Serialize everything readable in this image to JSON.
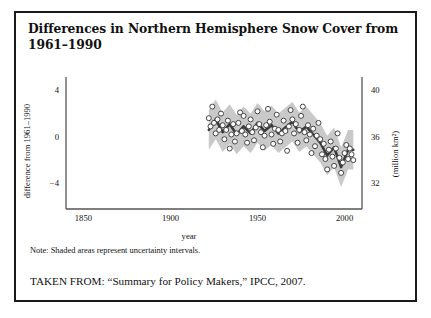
{
  "figure": {
    "title": "Differences in Northern Hemisphere Snow Cover from 1961–1990",
    "note": "Note: Shaded areas represent uncertainty intervals.",
    "source": "TAKEN FROM: “Summary for Policy Makers,” IPCC, 2007."
  },
  "colors": {
    "border": "#1a1a1a",
    "axis": "#555555",
    "trend_line": "#3a3a3a",
    "uncertainty_band": "#c9c9c9",
    "marker_fill": "#ffffff",
    "marker_stroke": "#444444",
    "text": "#111111"
  },
  "chart_data": {
    "type": "line",
    "title": "Differences in Northern Hemisphere Snow Cover from 1961–1990",
    "xlabel": "year",
    "ylabel": "difference from 1961–1990",
    "ylabel_right": "(million km²)",
    "xlim": [
      1840,
      2010
    ],
    "ylim": [
      -6.2,
      4.8
    ],
    "xticks": [
      1850,
      1900,
      1950,
      2000
    ],
    "yticks_left": [
      4,
      0,
      -4
    ],
    "yticks_right": [
      40,
      36,
      32
    ],
    "ylim_right": [
      29.8,
      40.8
    ],
    "grid": false,
    "legend": false,
    "series": [
      {
        "name": "annual anomaly",
        "type": "scatter",
        "marker": "open-circle",
        "x": [
          1922,
          1923,
          1924,
          1925,
          1926,
          1927,
          1928,
          1929,
          1930,
          1931,
          1932,
          1933,
          1934,
          1935,
          1936,
          1937,
          1938,
          1939,
          1940,
          1941,
          1942,
          1943,
          1944,
          1945,
          1946,
          1947,
          1948,
          1949,
          1950,
          1951,
          1952,
          1953,
          1954,
          1955,
          1956,
          1957,
          1958,
          1959,
          1960,
          1961,
          1962,
          1963,
          1964,
          1965,
          1966,
          1967,
          1968,
          1969,
          1970,
          1971,
          1972,
          1973,
          1974,
          1975,
          1976,
          1977,
          1978,
          1979,
          1980,
          1981,
          1982,
          1983,
          1984,
          1985,
          1986,
          1987,
          1988,
          1989,
          1990,
          1991,
          1992,
          1993,
          1994,
          1995,
          1996,
          1997,
          1998,
          1999,
          2000,
          2001,
          2002,
          2003,
          2004,
          2005
        ],
        "y": [
          1.6,
          0.9,
          2.6,
          1.2,
          0.3,
          1.5,
          0.6,
          2.0,
          1.0,
          -0.2,
          0.6,
          1.4,
          -1.0,
          0.2,
          1.1,
          -0.4,
          0.3,
          1.2,
          2.1,
          0.5,
          1.8,
          0.2,
          -0.5,
          0.9,
          1.5,
          0.4,
          -0.3,
          0.8,
          2.2,
          1.1,
          0.4,
          -0.9,
          0.1,
          1.0,
          2.4,
          1.3,
          0.2,
          -0.6,
          0.7,
          1.9,
          0.6,
          -0.4,
          0.3,
          1.4,
          0.5,
          -1.2,
          0.9,
          2.3,
          1.5,
          0.3,
          1.1,
          -0.5,
          0.6,
          1.8,
          2.6,
          0.4,
          -0.3,
          1.0,
          0.2,
          -1.4,
          0.7,
          -0.8,
          0.1,
          1.2,
          -0.2,
          -1.5,
          -0.6,
          -1.9,
          -2.8,
          -1.1,
          -0.4,
          -1.7,
          -2.5,
          -1.0,
          0.3,
          -1.8,
          -3.1,
          -2.2,
          -1.4,
          -0.7,
          -1.9,
          -1.0,
          -1.5,
          -2.0
        ]
      },
      {
        "name": "smoothed trend",
        "type": "line",
        "x": [
          1922,
          1926,
          1930,
          1934,
          1938,
          1942,
          1946,
          1950,
          1954,
          1958,
          1962,
          1966,
          1970,
          1974,
          1978,
          1982,
          1986,
          1990,
          1994,
          1998,
          2002,
          2005
        ],
        "y": [
          0.6,
          1.5,
          0.4,
          1.1,
          0.2,
          0.9,
          0.3,
          1.2,
          0.5,
          1.0,
          0.3,
          0.8,
          1.3,
          0.4,
          0.9,
          0.2,
          -0.5,
          -1.6,
          -0.9,
          -2.6,
          -1.1,
          -1.1
        ]
      },
      {
        "name": "uncertainty band",
        "type": "band",
        "x": [
          1922,
          1926,
          1930,
          1934,
          1938,
          1942,
          1946,
          1950,
          1954,
          1958,
          1962,
          1966,
          1970,
          1974,
          1978,
          1982,
          1986,
          1990,
          1994,
          1998,
          2002,
          2005
        ],
        "lower": [
          -1.1,
          -0.2,
          -1.3,
          -0.6,
          -1.5,
          -0.8,
          -1.4,
          -0.5,
          -1.2,
          -0.7,
          -1.4,
          -0.9,
          -0.4,
          -1.3,
          -0.8,
          -1.5,
          -2.2,
          -3.3,
          -2.6,
          -4.3,
          -2.8,
          -2.8
        ],
        "upper": [
          2.3,
          3.2,
          2.1,
          2.8,
          1.9,
          2.6,
          2.0,
          2.9,
          2.2,
          2.7,
          2.0,
          2.5,
          3.0,
          2.1,
          2.6,
          1.9,
          1.2,
          0.1,
          0.8,
          -0.9,
          0.6,
          0.6
        ]
      }
    ]
  }
}
